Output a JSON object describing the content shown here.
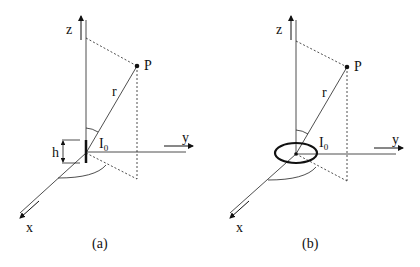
{
  "figure": {
    "panels": [
      {
        "id": "a",
        "caption": "(a)",
        "source": "short dipole of height h",
        "labels": {
          "z": "z",
          "y": "y",
          "x": "x",
          "point": "P",
          "distance": "r",
          "current": "I",
          "current_sub": "0",
          "height": "h"
        }
      },
      {
        "id": "b",
        "caption": "(b)",
        "source": "small current loop",
        "labels": {
          "z": "z",
          "y": "y",
          "x": "x",
          "point": "P",
          "distance": "r",
          "current": "I",
          "current_sub": "0"
        }
      }
    ]
  }
}
